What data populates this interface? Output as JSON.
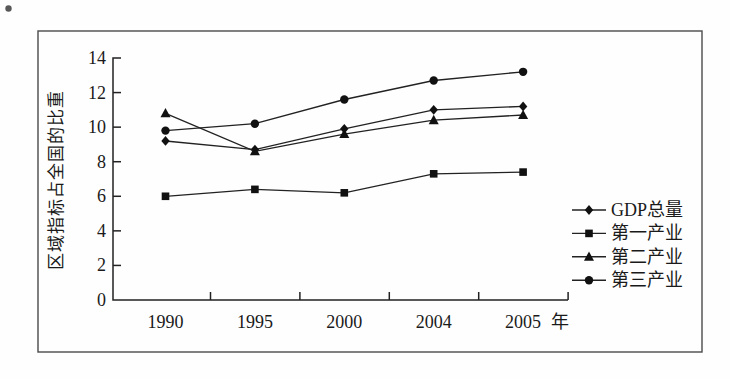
{
  "figure": {
    "background": "#fefefe",
    "border_color": "#4a4a4a",
    "line_color": "#222222",
    "marker_color": "#111111",
    "text_color": "#1a1a1a"
  },
  "chart_data": {
    "type": "line",
    "title": "",
    "categories": [
      "1990",
      "1995",
      "2000",
      "2004",
      "2005"
    ],
    "x_axis_suffix": "年",
    "xlabel": "",
    "ylabel": "区域指标占全国的比重",
    "ylim": [
      0,
      14
    ],
    "yticks": [
      0,
      2,
      4,
      6,
      8,
      10,
      12,
      14
    ],
    "grid": false,
    "legend_position": "right",
    "series": [
      {
        "name": "GDP总量",
        "marker": "diamond",
        "values": [
          9.2,
          8.7,
          9.9,
          11.0,
          11.2
        ]
      },
      {
        "name": "第一产业",
        "marker": "square",
        "values": [
          6.0,
          6.4,
          6.2,
          7.3,
          7.4
        ]
      },
      {
        "name": "第二产业",
        "marker": "triangle",
        "values": [
          10.8,
          8.6,
          9.6,
          10.4,
          10.7
        ]
      },
      {
        "name": "第三产业",
        "marker": "circle",
        "values": [
          9.8,
          10.2,
          11.6,
          12.7,
          13.2
        ]
      }
    ]
  }
}
